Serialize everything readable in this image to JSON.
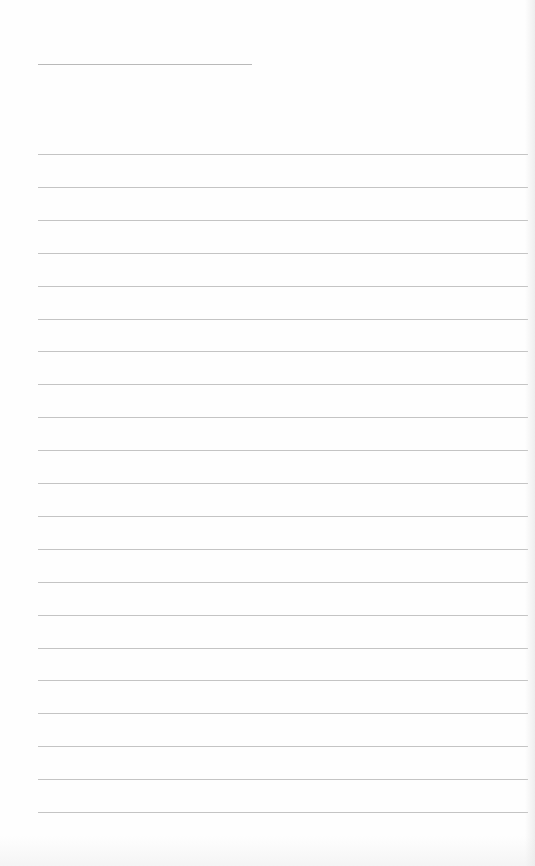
{
  "page": {
    "type": "blank lined notebook page",
    "background_color": "#fefefe",
    "line_color": "#c4c4c4"
  },
  "title_line": {
    "x": 38,
    "y": 64,
    "width": 214
  },
  "ruled_lines": {
    "count": 21,
    "x_start": 38,
    "x_end": 528,
    "first_y": 154,
    "spacing": 32.9
  },
  "text_content": []
}
